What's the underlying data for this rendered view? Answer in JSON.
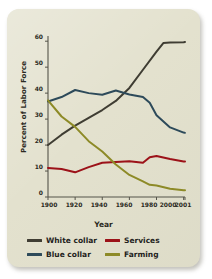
{
  "chart_data": {
    "type": "line",
    "title": "",
    "xlabel": "Year",
    "ylabel": "Percent of Labor Force",
    "xlim": [
      1900,
      2001
    ],
    "ylim": [
      0,
      62
    ],
    "yticks": [
      0,
      10,
      20,
      30,
      40,
      50,
      60
    ],
    "xticks": [
      1900,
      1920,
      1940,
      1960,
      1980,
      2000,
      2001
    ],
    "xtick_labels": [
      "1900",
      "1920",
      "1940",
      "1960",
      "1980",
      "2000",
      "2001"
    ],
    "ytick_labels": [
      "0",
      "10",
      "20",
      "30",
      "40",
      "50",
      "60"
    ],
    "grid": false,
    "legend_position": "bottom",
    "series": [
      {
        "name": "White collar",
        "color": "#3f3d33",
        "x": [
          1900,
          1910,
          1920,
          1930,
          1940,
          1950,
          1960,
          1970,
          1980,
          1985,
          1990,
          2000,
          2001
        ],
        "values": [
          20.0,
          24.0,
          27.5,
          30.5,
          33.5,
          37.0,
          42.0,
          49.0,
          56.0,
          59.3,
          59.5,
          59.6,
          59.7
        ]
      },
      {
        "name": "Blue collar",
        "color": "#2d4a5a",
        "x": [
          1900,
          1910,
          1920,
          1930,
          1940,
          1950,
          1960,
          1970,
          1975,
          1980,
          1990,
          2000,
          2001
        ],
        "values": [
          36.8,
          38.5,
          41.2,
          40.0,
          39.4,
          41.0,
          39.5,
          38.5,
          36.3,
          31.5,
          26.8,
          24.8,
          24.7
        ]
      },
      {
        "name": "Services",
        "color": "#9c1219",
        "x": [
          1900,
          1910,
          1920,
          1930,
          1940,
          1950,
          1960,
          1970,
          1975,
          1980,
          1990,
          2000,
          2001
        ],
        "values": [
          11.2,
          10.8,
          9.5,
          11.5,
          13.2,
          13.5,
          13.8,
          13.2,
          15.3,
          15.8,
          14.6,
          13.7,
          13.7
        ]
      },
      {
        "name": "Farming",
        "color": "#8d8a27",
        "x": [
          1900,
          1910,
          1920,
          1930,
          1940,
          1950,
          1960,
          1970,
          1975,
          1980,
          1990,
          2000,
          2001
        ],
        "values": [
          37.2,
          31.0,
          27.0,
          21.5,
          17.5,
          12.5,
          8.5,
          6.0,
          4.7,
          4.4,
          3.2,
          2.6,
          2.6
        ]
      }
    ]
  },
  "axes": {
    "ylabel": "Percent of Labor Force",
    "xlabel": "Year",
    "ytick_0": "0",
    "ytick_10": "10",
    "ytick_20": "20",
    "ytick_30": "30",
    "ytick_40": "40",
    "ytick_50": "50",
    "ytick_60": "60",
    "xtick_1900": "1900",
    "xtick_1920": "1920",
    "xtick_1940": "1940",
    "xtick_1960": "1960",
    "xtick_1980": "1980",
    "xtick_2000": "2000",
    "xtick_2001": "2001"
  },
  "legend": {
    "items": [
      {
        "label": "White collar",
        "color": "#3f3d33"
      },
      {
        "label": "Services",
        "color": "#9c1219"
      },
      {
        "label": "Blue collar",
        "color": "#2d4a5a"
      },
      {
        "label": "Farming",
        "color": "#8d8a27"
      }
    ]
  },
  "colors": {
    "card_background": "#e2e0cc",
    "page_background": "#ffffff",
    "axis": "#55544a",
    "text": "#2b2a22"
  }
}
